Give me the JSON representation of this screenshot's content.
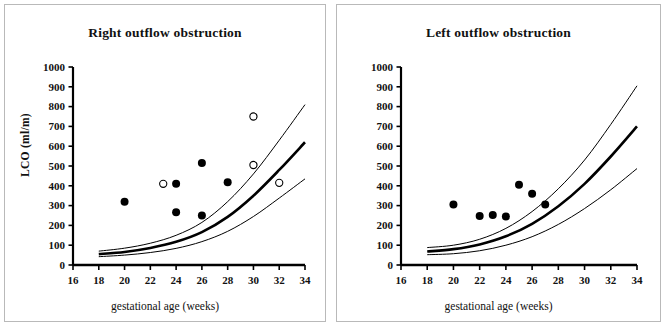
{
  "figure": {
    "xlabel": "gestational age (weeks)",
    "panels": [
      {
        "id": "left",
        "title": "Right outflow obstruction",
        "ylabel": "LCO (ml/m)"
      },
      {
        "id": "right",
        "title": "Left outflow obstruction",
        "ylabel": "RCO (ml/m)"
      }
    ]
  },
  "chart_data": [
    {
      "type": "scatter",
      "title": "Right outflow obstruction",
      "xlabel": "gestational age (weeks)",
      "ylabel": "LCO (ml/m)",
      "xlim": [
        16,
        34
      ],
      "ylim": [
        0,
        1000
      ],
      "xticks": [
        16,
        18,
        20,
        22,
        24,
        26,
        28,
        30,
        32,
        34
      ],
      "yticks": [
        0,
        100,
        200,
        300,
        400,
        500,
        600,
        700,
        800,
        900,
        1000
      ],
      "grid": false,
      "legend": "none",
      "series": [
        {
          "name": "filled circles",
          "marker": "filled-circle",
          "points": [
            [
              20,
              320
            ],
            [
              24,
              410
            ],
            [
              24,
              267
            ],
            [
              26,
              515
            ],
            [
              26,
              250
            ],
            [
              28,
              418
            ]
          ]
        },
        {
          "name": "open circles",
          "marker": "open-circle",
          "points": [
            [
              23,
              410
            ],
            [
              30,
              750
            ],
            [
              30,
              505
            ],
            [
              32,
              415
            ]
          ]
        }
      ],
      "reference_curves": [
        {
          "name": "upper reference limit",
          "style": "thin",
          "x": [
            18,
            20,
            22,
            24,
            26,
            28,
            30,
            32,
            34
          ],
          "y": [
            70,
            85,
            110,
            150,
            215,
            320,
            460,
            630,
            810
          ]
        },
        {
          "name": "median",
          "style": "thick",
          "x": [
            18,
            20,
            22,
            24,
            26,
            28,
            30,
            32,
            34
          ],
          "y": [
            55,
            66,
            86,
            117,
            166,
            243,
            350,
            480,
            620
          ]
        },
        {
          "name": "lower reference limit",
          "style": "thin",
          "x": [
            18,
            20,
            22,
            24,
            26,
            28,
            30,
            32,
            34
          ],
          "y": [
            42,
            50,
            63,
            84,
            118,
            170,
            245,
            338,
            435
          ]
        }
      ]
    },
    {
      "type": "scatter",
      "title": "Left outflow obstruction",
      "xlabel": "gestational age (weeks)",
      "ylabel": "RCO (ml/m)",
      "xlim": [
        16,
        34
      ],
      "ylim": [
        0,
        1000
      ],
      "xticks": [
        16,
        18,
        20,
        22,
        24,
        26,
        28,
        30,
        32,
        34
      ],
      "yticks": [
        0,
        100,
        200,
        300,
        400,
        500,
        600,
        700,
        800,
        900,
        1000
      ],
      "grid": false,
      "legend": "none",
      "series": [
        {
          "name": "filled circles",
          "marker": "filled-circle",
          "points": [
            [
              20,
              305
            ],
            [
              22,
              248
            ],
            [
              23,
              253
            ],
            [
              24,
              245
            ],
            [
              25,
              405
            ],
            [
              26,
              360
            ],
            [
              27,
              305
            ]
          ]
        }
      ],
      "reference_curves": [
        {
          "name": "upper reference limit",
          "style": "thin",
          "x": [
            18,
            20,
            22,
            24,
            26,
            28,
            30,
            32,
            34
          ],
          "y": [
            88,
            100,
            130,
            185,
            270,
            385,
            530,
            710,
            905
          ]
        },
        {
          "name": "median",
          "style": "thick",
          "x": [
            18,
            20,
            22,
            24,
            26,
            28,
            30,
            32,
            34
          ],
          "y": [
            68,
            80,
            104,
            145,
            208,
            297,
            410,
            548,
            700
          ]
        },
        {
          "name": "lower reference limit",
          "style": "thin",
          "x": [
            18,
            20,
            22,
            24,
            26,
            28,
            30,
            32,
            34
          ],
          "y": [
            52,
            57,
            72,
            100,
            143,
            205,
            285,
            380,
            487
          ]
        }
      ]
    }
  ]
}
